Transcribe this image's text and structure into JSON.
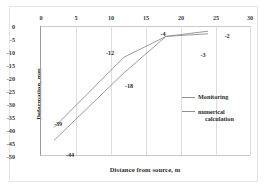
{
  "chart_data": {
    "type": "line",
    "title": "",
    "xlabel": "Distance from source, m",
    "ylabel": "Deformation, mm",
    "xlim": [
      0,
      30
    ],
    "ylim": [
      -50,
      0
    ],
    "xticks": [
      0,
      5,
      10,
      15,
      20,
      25,
      30
    ],
    "ytick_labels": [
      "0",
      "-5",
      "-10",
      "-15",
      "-20",
      "-25",
      "-30",
      "-35",
      "-40",
      "-45",
      "-50"
    ],
    "yticks": [
      0,
      -5,
      -10,
      -15,
      -20,
      -25,
      -30,
      -35,
      -40,
      -45,
      -50
    ],
    "grid": "vertical",
    "legend_position": "inside-right",
    "series": [
      {
        "name": "Monitoring",
        "color": "#8e8e8e",
        "x": [
          2,
          12,
          18,
          24
        ],
        "y": [
          -39,
          -12,
          -4,
          -2
        ]
      },
      {
        "name": "numerical calculation",
        "color": "#8e8e8e",
        "x": [
          2,
          12,
          18,
          24
        ],
        "y": [
          -44,
          -18,
          -4,
          -3
        ]
      }
    ],
    "annotations": [
      {
        "text": "-39",
        "x": 2,
        "y": -39,
        "px": 58,
        "py": 123
      },
      {
        "text": "-44",
        "x": 2,
        "y": -44,
        "px": 70,
        "py": 154
      },
      {
        "text": "-12",
        "x": 12,
        "y": -12,
        "px": 110,
        "py": 52
      },
      {
        "text": "-18",
        "x": 12,
        "y": -18,
        "px": 129,
        "py": 85
      },
      {
        "text": "-4",
        "x": 18,
        "y": -4,
        "px": 163,
        "py": 33
      },
      {
        "text": "-2",
        "x": 24,
        "y": -2,
        "px": 227,
        "py": 35
      },
      {
        "text": "-3",
        "x": 24,
        "y": -3,
        "px": 203,
        "py": 54
      }
    ],
    "legend_entries": [
      {
        "label": "Monitoring",
        "line1": "Monitoring",
        "line2": ""
      },
      {
        "label": "numerical calculation",
        "line1": "numerical",
        "line2": "calculation"
      }
    ]
  }
}
